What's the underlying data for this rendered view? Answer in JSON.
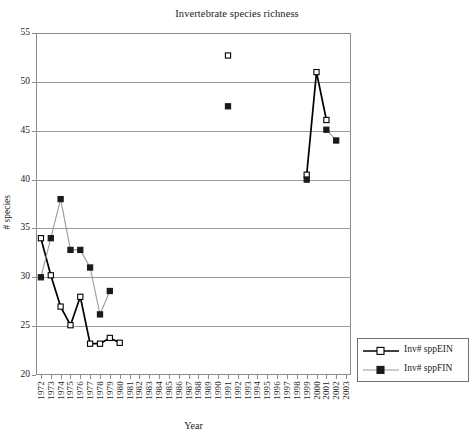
{
  "chart_data": {
    "type": "line",
    "title": "Invertebrate species richness",
    "xlabel": "Year",
    "ylabel": "# species",
    "grid": true,
    "legend_position": "bottom-right",
    "ylim": [
      20,
      55
    ],
    "yticks": [
      20,
      25,
      30,
      35,
      40,
      45,
      50,
      55
    ],
    "categories": [
      "1972",
      "1973",
      "1974",
      "1975",
      "1976",
      "1977",
      "1978",
      "1979",
      "1980",
      "1981",
      "1982",
      "1983",
      "1984",
      "1985",
      "1986",
      "1987",
      "1988",
      "1989",
      "1990",
      "1991",
      "1992",
      "1993",
      "1994",
      "1995",
      "1996",
      "1997",
      "1998",
      "1999",
      "2000",
      "2001",
      "2002",
      "2003"
    ],
    "series": [
      {
        "name": "Inv# sppEIN",
        "marker": "open-square",
        "color": "#000000",
        "points": [
          {
            "x": "1972",
            "y": 34.0
          },
          {
            "x": "1973",
            "y": 30.2
          },
          {
            "x": "1974",
            "y": 27.0
          },
          {
            "x": "1975",
            "y": 25.1
          },
          {
            "x": "1976",
            "y": 28.0
          },
          {
            "x": "1977",
            "y": 23.2
          },
          {
            "x": "1978",
            "y": 23.2
          },
          {
            "x": "1979",
            "y": 23.8
          },
          {
            "x": "1980",
            "y": 23.3
          },
          {
            "x": "1991",
            "y": 52.7
          },
          {
            "x": "1999",
            "y": 40.5
          },
          {
            "x": "2000",
            "y": 51.0
          },
          {
            "x": "2001",
            "y": 46.1
          }
        ]
      },
      {
        "name": "Inv# sppFIN",
        "marker": "filled-square",
        "color": "#1a1a1a",
        "line_color": "#9a9a9a",
        "points": [
          {
            "x": "1972",
            "y": 30.0
          },
          {
            "x": "1973",
            "y": 34.0
          },
          {
            "x": "1974",
            "y": 38.0
          },
          {
            "x": "1975",
            "y": 32.8
          },
          {
            "x": "1976",
            "y": 32.8
          },
          {
            "x": "1977",
            "y": 31.0
          },
          {
            "x": "1978",
            "y": 26.2
          },
          {
            "x": "1979",
            "y": 28.6
          },
          {
            "x": "1991",
            "y": 47.5
          },
          {
            "x": "1999",
            "y": 40.0
          },
          {
            "x": "2001",
            "y": 45.1
          },
          {
            "x": "2002",
            "y": 44.0
          }
        ]
      }
    ],
    "annotations": []
  },
  "legend": {
    "entries": [
      {
        "label": "Inv# sppEIN"
      },
      {
        "label": "Inv# sppFIN"
      }
    ]
  }
}
